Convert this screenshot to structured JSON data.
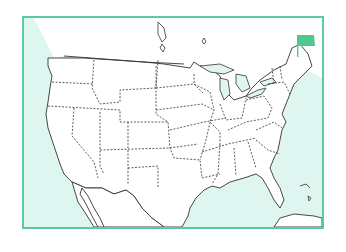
{
  "map": {
    "title": "",
    "region": "Contiguous United States",
    "style": "outline-with-dashed-state-borders",
    "colors": {
      "frame_border": "#5ec99b",
      "water": "#dff5f0",
      "land": "#ffffff",
      "coast_line": "#333333",
      "state_border": "#333333",
      "marker": "#4fc98f"
    },
    "marker": {
      "icon": "flag-icon",
      "location": "Maine",
      "color": "#4fc98f"
    }
  }
}
